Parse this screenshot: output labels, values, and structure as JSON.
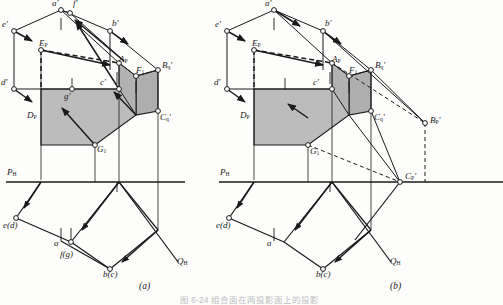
{
  "figure": {
    "caption": "图 6-24   组合面在两投影面上的投影",
    "panels": [
      {
        "id": "a",
        "label": "(a)"
      },
      {
        "id": "b",
        "label": "(b)"
      }
    ]
  },
  "colors": {
    "stroke": "#1a1a1a",
    "fill_shaded": "#b9b9b9",
    "fill_shaded_dark": "#a6a6a6",
    "background": "#fdfdfc",
    "dashed": "#1a1a1a"
  },
  "panel_a": {
    "ground_line": "P",
    "ground_line_sub": "H",
    "trace_line": "Q",
    "trace_line_sub": "H",
    "v_labels": [
      {
        "name": "a-prime",
        "text": "a",
        "prime": "'",
        "sub": ""
      },
      {
        "name": "f-prime",
        "text": "f",
        "prime": "'",
        "sub": ""
      },
      {
        "name": "b-prime",
        "text": "b",
        "prime": "'",
        "sub": ""
      },
      {
        "name": "e-prime",
        "text": "e",
        "prime": "'",
        "sub": ""
      },
      {
        "name": "d-prime",
        "text": "d",
        "prime": "'",
        "sub": ""
      },
      {
        "name": "c-prime",
        "text": "c",
        "prime": "'",
        "sub": ""
      },
      {
        "name": "g-prime",
        "text": "g",
        "prime": "'",
        "sub": ""
      },
      {
        "name": "E-P",
        "text": "E",
        "prime": "",
        "sub": "P"
      },
      {
        "name": "D-P",
        "text": "D",
        "prime": "",
        "sub": "P"
      },
      {
        "name": "A-P",
        "text": "A",
        "prime": "",
        "sub": "P"
      },
      {
        "name": "F-1",
        "text": "F",
        "prime": "",
        "sub": "1"
      },
      {
        "name": "B-q-prime",
        "text": "B",
        "prime": "'",
        "sub": "q"
      },
      {
        "name": "C-q-prime",
        "text": "C",
        "prime": "'",
        "sub": "q"
      },
      {
        "name": "G-1",
        "text": "G",
        "prime": "",
        "sub": "1"
      }
    ],
    "h_labels": [
      {
        "name": "e-d",
        "text": "e(d)"
      },
      {
        "name": "a",
        "text": "a"
      },
      {
        "name": "f-g",
        "text": "f(g)"
      },
      {
        "name": "b-c",
        "text": "b(c)"
      }
    ]
  },
  "panel_b": {
    "ground_line": "P",
    "ground_line_sub": "H",
    "trace_line": "Q",
    "trace_line_sub": "H",
    "v_labels": [
      {
        "name": "a-prime",
        "text": "a",
        "prime": "'",
        "sub": ""
      },
      {
        "name": "b-prime",
        "text": "b",
        "prime": "'",
        "sub": ""
      },
      {
        "name": "e-prime",
        "text": "e",
        "prime": "'",
        "sub": ""
      },
      {
        "name": "d-prime",
        "text": "d",
        "prime": "'",
        "sub": ""
      },
      {
        "name": "c-prime",
        "text": "c",
        "prime": "'",
        "sub": ""
      },
      {
        "name": "E-P",
        "text": "E",
        "prime": "",
        "sub": "P"
      },
      {
        "name": "D-P",
        "text": "D",
        "prime": "",
        "sub": "P"
      },
      {
        "name": "A-P",
        "text": "A",
        "prime": "",
        "sub": "P"
      },
      {
        "name": "F-1",
        "text": "F",
        "prime": "",
        "sub": "1"
      },
      {
        "name": "B-q-prime",
        "text": "B",
        "prime": "'",
        "sub": "q"
      },
      {
        "name": "B-P-prime",
        "text": "B",
        "prime": "'",
        "sub": "P"
      },
      {
        "name": "C-q-prime",
        "text": "C",
        "prime": "'",
        "sub": "q"
      },
      {
        "name": "C-P-prime",
        "text": "C",
        "prime": "'",
        "sub": "P"
      },
      {
        "name": "G-1",
        "text": "G",
        "prime": "",
        "sub": "1"
      }
    ],
    "h_labels": [
      {
        "name": "e-d",
        "text": "e(d)"
      },
      {
        "name": "a",
        "text": "a"
      },
      {
        "name": "b-c",
        "text": "b(c)"
      }
    ]
  }
}
